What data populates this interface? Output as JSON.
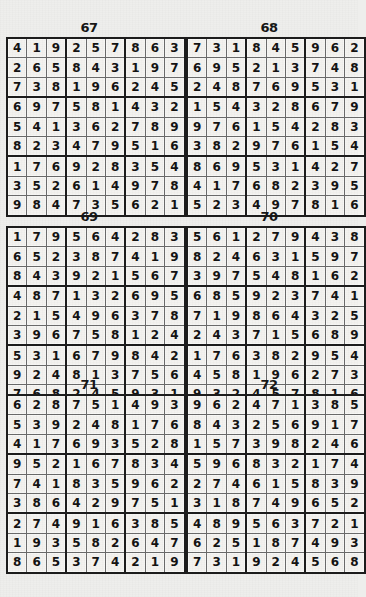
{
  "page": {
    "background_color": "#eeeeec",
    "grid_line_color": "#6a6a6a",
    "block_line_color": "#1c1c1c",
    "text_color": "#131313"
  },
  "puzzles": [
    {
      "number": "67",
      "rows": [
        [
          "4",
          "1",
          "9",
          "2",
          "5",
          "7",
          "8",
          "6",
          "3"
        ],
        [
          "2",
          "6",
          "5",
          "8",
          "4",
          "3",
          "1",
          "9",
          "7"
        ],
        [
          "7",
          "3",
          "8",
          "1",
          "9",
          "6",
          "2",
          "4",
          "5"
        ],
        [
          "6",
          "9",
          "7",
          "5",
          "8",
          "1",
          "4",
          "3",
          "2"
        ],
        [
          "5",
          "4",
          "1",
          "3",
          "6",
          "2",
          "7",
          "8",
          "9"
        ],
        [
          "8",
          "2",
          "3",
          "4",
          "7",
          "9",
          "5",
          "1",
          "6"
        ],
        [
          "1",
          "7",
          "6",
          "9",
          "2",
          "8",
          "3",
          "5",
          "4"
        ],
        [
          "3",
          "5",
          "2",
          "6",
          "1",
          "4",
          "9",
          "7",
          "8"
        ],
        [
          "9",
          "8",
          "4",
          "7",
          "3",
          "5",
          "6",
          "2",
          "1"
        ]
      ]
    },
    {
      "number": "68",
      "rows": [
        [
          "7",
          "3",
          "1",
          "8",
          "4",
          "5",
          "9",
          "6",
          "2"
        ],
        [
          "6",
          "9",
          "5",
          "2",
          "1",
          "3",
          "7",
          "4",
          "8"
        ],
        [
          "2",
          "4",
          "8",
          "7",
          "6",
          "9",
          "5",
          "3",
          "1"
        ],
        [
          "1",
          "5",
          "4",
          "3",
          "2",
          "8",
          "6",
          "7",
          "9"
        ],
        [
          "9",
          "7",
          "6",
          "1",
          "5",
          "4",
          "2",
          "8",
          "3"
        ],
        [
          "3",
          "8",
          "2",
          "9",
          "7",
          "6",
          "1",
          "5",
          "4"
        ],
        [
          "8",
          "6",
          "9",
          "5",
          "3",
          "1",
          "4",
          "2",
          "7"
        ],
        [
          "4",
          "1",
          "7",
          "6",
          "8",
          "2",
          "3",
          "9",
          "5"
        ],
        [
          "5",
          "2",
          "3",
          "4",
          "9",
          "7",
          "8",
          "1",
          "6"
        ]
      ]
    },
    {
      "number": "69",
      "rows": [
        [
          "1",
          "7",
          "9",
          "5",
          "6",
          "4",
          "2",
          "8",
          "3"
        ],
        [
          "6",
          "5",
          "2",
          "3",
          "8",
          "7",
          "4",
          "1",
          "9"
        ],
        [
          "8",
          "4",
          "3",
          "9",
          "2",
          "1",
          "5",
          "6",
          "7"
        ],
        [
          "4",
          "8",
          "7",
          "1",
          "3",
          "2",
          "6",
          "9",
          "5"
        ],
        [
          "2",
          "1",
          "5",
          "4",
          "9",
          "6",
          "3",
          "7",
          "8"
        ],
        [
          "3",
          "9",
          "6",
          "7",
          "5",
          "8",
          "1",
          "2",
          "4"
        ],
        [
          "5",
          "3",
          "1",
          "6",
          "7",
          "9",
          "8",
          "4",
          "2"
        ],
        [
          "9",
          "2",
          "4",
          "8",
          "1",
          "3",
          "7",
          "5",
          "6"
        ],
        [
          "7",
          "6",
          "8",
          "2",
          "4",
          "5",
          "9",
          "3",
          "1"
        ]
      ]
    },
    {
      "number": "70",
      "rows": [
        [
          "5",
          "6",
          "1",
          "2",
          "7",
          "9",
          "4",
          "3",
          "8"
        ],
        [
          "8",
          "2",
          "4",
          "6",
          "3",
          "1",
          "5",
          "9",
          "7"
        ],
        [
          "3",
          "9",
          "7",
          "5",
          "4",
          "8",
          "1",
          "6",
          "2"
        ],
        [
          "6",
          "8",
          "5",
          "9",
          "2",
          "3",
          "7",
          "4",
          "1"
        ],
        [
          "7",
          "1",
          "9",
          "8",
          "6",
          "4",
          "3",
          "2",
          "5"
        ],
        [
          "2",
          "4",
          "3",
          "7",
          "1",
          "5",
          "6",
          "8",
          "9"
        ],
        [
          "1",
          "7",
          "6",
          "3",
          "8",
          "2",
          "9",
          "5",
          "4"
        ],
        [
          "4",
          "5",
          "8",
          "1",
          "9",
          "6",
          "2",
          "7",
          "3"
        ],
        [
          "9",
          "3",
          "2",
          "4",
          "5",
          "7",
          "8",
          "1",
          "6"
        ]
      ]
    },
    {
      "number": "71",
      "rows": [
        [
          "6",
          "2",
          "8",
          "7",
          "5",
          "1",
          "4",
          "9",
          "3"
        ],
        [
          "5",
          "3",
          "9",
          "2",
          "4",
          "8",
          "1",
          "7",
          "6"
        ],
        [
          "4",
          "1",
          "7",
          "6",
          "9",
          "3",
          "5",
          "2",
          "8"
        ],
        [
          "9",
          "5",
          "2",
          "1",
          "6",
          "7",
          "8",
          "3",
          "4"
        ],
        [
          "7",
          "4",
          "1",
          "8",
          "3",
          "5",
          "9",
          "6",
          "2"
        ],
        [
          "3",
          "8",
          "6",
          "4",
          "2",
          "9",
          "7",
          "5",
          "1"
        ],
        [
          "2",
          "7",
          "4",
          "9",
          "1",
          "6",
          "3",
          "8",
          "5"
        ],
        [
          "1",
          "9",
          "3",
          "5",
          "8",
          "2",
          "6",
          "4",
          "7"
        ],
        [
          "8",
          "6",
          "5",
          "3",
          "7",
          "4",
          "2",
          "1",
          "9"
        ]
      ]
    },
    {
      "number": "72",
      "rows": [
        [
          "9",
          "6",
          "2",
          "4",
          "7",
          "1",
          "3",
          "8",
          "5"
        ],
        [
          "8",
          "4",
          "3",
          "2",
          "5",
          "6",
          "9",
          "1",
          "7"
        ],
        [
          "1",
          "5",
          "7",
          "3",
          "9",
          "8",
          "2",
          "4",
          "6"
        ],
        [
          "5",
          "9",
          "6",
          "8",
          "3",
          "2",
          "1",
          "7",
          "4"
        ],
        [
          "2",
          "7",
          "4",
          "6",
          "1",
          "5",
          "8",
          "3",
          "9"
        ],
        [
          "3",
          "1",
          "8",
          "7",
          "4",
          "9",
          "6",
          "5",
          "2"
        ],
        [
          "4",
          "8",
          "9",
          "5",
          "6",
          "3",
          "7",
          "2",
          "1"
        ],
        [
          "6",
          "2",
          "5",
          "1",
          "8",
          "7",
          "4",
          "9",
          "3"
        ],
        [
          "7",
          "3",
          "1",
          "9",
          "2",
          "4",
          "5",
          "6",
          "8"
        ]
      ]
    }
  ]
}
